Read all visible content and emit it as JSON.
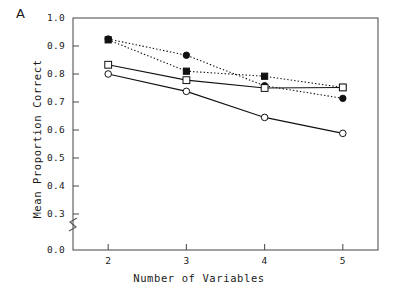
{
  "panel": {
    "label": "A"
  },
  "chart_data": {
    "type": "line",
    "title": "",
    "xlabel": "Number of Variables",
    "ylabel": "Mean Proportion Correct",
    "x": [
      2,
      3,
      4,
      5
    ],
    "categories": [
      "2",
      "3",
      "4",
      "5"
    ],
    "xlim": [
      1.55,
      5.45
    ],
    "ylim": [
      0.25,
      1.0
    ],
    "xticks": [
      "2",
      "3",
      "4",
      "5"
    ],
    "yticks": [
      "1.0",
      "0.9",
      "0.8",
      "0.7",
      "0.6",
      "0.5",
      "0.4",
      "0.3",
      "0.0"
    ],
    "ytick_values": [
      1.0,
      0.9,
      0.8,
      0.7,
      0.6,
      0.5,
      0.4,
      0.3,
      0.0
    ],
    "axis_break": true,
    "axis_break_between": [
      "0.3",
      "0.0"
    ],
    "grid": false,
    "legend": "none",
    "frame": "box",
    "series": [
      {
        "name": "filled-circle-dotted",
        "marker": "filled-circle",
        "linestyle": "dotted",
        "color": "#111111",
        "values": [
          0.925,
          0.867,
          0.758,
          0.713
        ]
      },
      {
        "name": "filled-square-dotted",
        "marker": "filled-square",
        "linestyle": "dotted",
        "color": "#111111",
        "values": [
          0.922,
          0.81,
          0.792,
          0.752
        ]
      },
      {
        "name": "open-square-solid",
        "marker": "open-square",
        "linestyle": "solid",
        "color": "#111111",
        "values": [
          0.833,
          0.778,
          0.75,
          0.752
        ]
      },
      {
        "name": "open-circle-solid",
        "marker": "open-circle",
        "linestyle": "solid",
        "color": "#111111",
        "values": [
          0.8,
          0.738,
          0.645,
          0.588
        ]
      }
    ]
  }
}
